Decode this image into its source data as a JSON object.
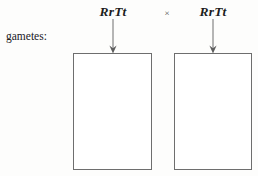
{
  "figure": {
    "background_color": "#fdfdfc",
    "line_color": "#6e6e6e",
    "text_color": "#1d1d1d"
  },
  "cross": {
    "parent_1_genotype": "RrTt",
    "cross_symbol": "×",
    "parent_2_genotype": "RrTt"
  },
  "labels": {
    "gametes_row": "gametes:"
  },
  "arrows": [
    {
      "name": "arrow-to-gamete-box-1",
      "direction": "down",
      "from": "RrTt",
      "to": "gamete box 1"
    },
    {
      "name": "arrow-to-gamete-box-2",
      "direction": "down",
      "from": "RrTt",
      "to": "gamete box 2"
    }
  ],
  "gamete_boxes": [
    {
      "name": "gamete-box-1",
      "content": "",
      "filled": false
    },
    {
      "name": "gamete-box-2",
      "content": "",
      "filled": false
    }
  ]
}
